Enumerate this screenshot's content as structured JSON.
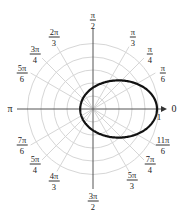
{
  "chart_data": {
    "type": "line",
    "coordinate_system": "polar",
    "title": "",
    "equation": "r = 1/(3 - 2cos θ)",
    "curve": {
      "description": "ellipse with focus at origin",
      "theta_deg": [
        0,
        30,
        60,
        90,
        120,
        150,
        180,
        210,
        240,
        270,
        300,
        330
      ],
      "r": [
        1.0,
        0.78,
        0.5,
        0.333,
        0.25,
        0.21,
        0.2,
        0.21,
        0.25,
        0.333,
        0.5,
        0.78
      ]
    },
    "radial_grid": [
      0.2,
      0.4,
      0.6,
      0.8,
      1.0
    ],
    "radial_tick_label": "1",
    "grid": true,
    "angle_labels": [
      {
        "num": "",
        "den": "",
        "text": "0",
        "deg": 0
      },
      {
        "num": "π",
        "den": "6",
        "deg": 30
      },
      {
        "num": "π",
        "den": "4",
        "deg": 45
      },
      {
        "num": "π",
        "den": "3",
        "deg": 60
      },
      {
        "num": "π",
        "den": "2",
        "deg": 90
      },
      {
        "num": "2π",
        "den": "3",
        "deg": 120
      },
      {
        "num": "3π",
        "den": "4",
        "deg": 135
      },
      {
        "num": "5π",
        "den": "6",
        "deg": 150
      },
      {
        "num": "",
        "den": "",
        "text": "π",
        "deg": 180
      },
      {
        "num": "7π",
        "den": "6",
        "deg": 210
      },
      {
        "num": "5π",
        "den": "4",
        "deg": 225
      },
      {
        "num": "4π",
        "den": "3",
        "deg": 240
      },
      {
        "num": "3π",
        "den": "2",
        "deg": 270
      },
      {
        "num": "5π",
        "den": "3",
        "deg": 300
      },
      {
        "num": "7π",
        "den": "4",
        "deg": 315
      },
      {
        "num": "11π",
        "den": "6",
        "deg": 330
      }
    ]
  },
  "labels": {
    "zero": "0",
    "pi": "π",
    "one": "1",
    "pi_6": {
      "num": "π",
      "den": "6"
    },
    "pi_4": {
      "num": "π",
      "den": "4"
    },
    "pi_3": {
      "num": "π",
      "den": "3"
    },
    "pi_2": {
      "num": "π",
      "den": "2"
    },
    "two_pi_3": {
      "num": "2π",
      "den": "3"
    },
    "three_pi_4": {
      "num": "3π",
      "den": "4"
    },
    "five_pi_6": {
      "num": "5π",
      "den": "6"
    },
    "seven_pi_6": {
      "num": "7π",
      "den": "6"
    },
    "five_pi_4": {
      "num": "5π",
      "den": "4"
    },
    "four_pi_3": {
      "num": "4π",
      "den": "3"
    },
    "three_pi_2": {
      "num": "3π",
      "den": "2"
    },
    "five_pi_3": {
      "num": "5π",
      "den": "3"
    },
    "seven_pi_4": {
      "num": "7π",
      "den": "4"
    },
    "eleven_pi_6": {
      "num": "11π",
      "den": "6"
    }
  },
  "colors": {
    "grid": "#d4d4d4",
    "axis": "#444444",
    "curve": "#111111"
  }
}
